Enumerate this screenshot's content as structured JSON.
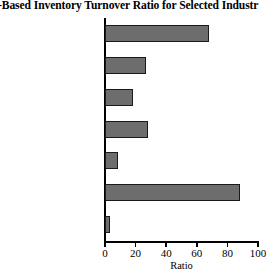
{
  "title": "es-Based Inventory Turnover Ratio for Selected Industr",
  "axis": {
    "x_title": "Ratio",
    "x_ticks": [
      "0",
      "20",
      "40",
      "60",
      "80",
      "100"
    ]
  },
  "colors": {
    "bar_fill": "#6d6d6d",
    "bar_border": "#1a1a1a",
    "axis": "#000000",
    "background": "#ffffff"
  },
  "chart_data": {
    "type": "bar",
    "orientation": "horizontal",
    "title": "es-Based Inventory Turnover Ratio for Selected Industr",
    "xlabel": "Ratio",
    "ylabel": "",
    "xlim": [
      0,
      100
    ],
    "xticks": [
      0,
      20,
      40,
      60,
      80,
      100
    ],
    "grid": false,
    "legend": false,
    "categories": [
      "Eating & drinking",
      "Motion pictures",
      "Food stores",
      "Printing & publishing",
      "Electrical equipment",
      "Educational services",
      "General merchandise"
    ],
    "values": [
      68,
      27,
      18,
      28,
      8.5,
      88,
      3.5
    ]
  }
}
